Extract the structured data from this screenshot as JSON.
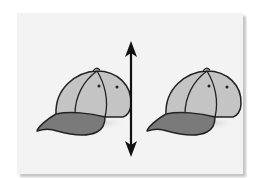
{
  "figure": {
    "panel_color": "#f3f3f3",
    "shadow_color": "#9a9a9a",
    "objects": [
      {
        "name": "cap-left",
        "crown_color": "#c4c4c4",
        "brim_color": "#7a7a7a",
        "outline_color": "#222222"
      },
      {
        "name": "cap-right",
        "crown_color": "#c4c4c4",
        "brim_color": "#7a7a7a",
        "outline_color": "#222222"
      }
    ],
    "divider": {
      "type": "double-headed-arrow",
      "orientation": "vertical",
      "color": "#111111"
    }
  }
}
